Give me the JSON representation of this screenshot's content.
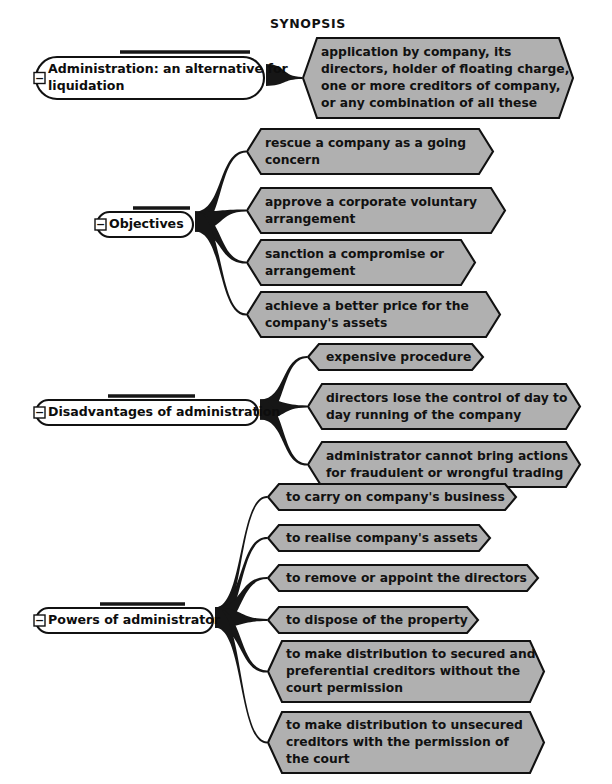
{
  "document": {
    "title": "SYNOPSIS",
    "title_x": 270,
    "title_y": 16
  },
  "style": {
    "page_background": "#ffffff",
    "leaf_fill": "#b0b0b0",
    "leaf_stroke": "#111111",
    "parent_fill": "#ffffff",
    "parent_stroke": "#111111",
    "connector_color": "#161616",
    "text_color": "#111111"
  },
  "mindmap": {
    "collapse_glyph": "−",
    "branches": [
      {
        "id": "administration",
        "parent": {
          "label": "Administration: an alternative for liquidation",
          "lines": [
            "Administration: an alternative for",
            "liquidation"
          ],
          "x": 36,
          "y": 57,
          "width": 228,
          "height": 42,
          "collapsed": false,
          "underline_x1": 120,
          "underline_x2": 250,
          "underline_y": 52
        },
        "children": [
          {
            "label": "application by company, its directors, holder of floating charge, one or more creditors of company, or any combination of all these",
            "lines": [
              "application by company, its",
              "directors, holder of floating charge,",
              "one or more creditors of company,",
              "or any combination of all these"
            ],
            "x": 303,
            "y": 38,
            "width": 270,
            "height": 80
          }
        ]
      },
      {
        "id": "objectives",
        "parent": {
          "label": "Objectives",
          "lines": [
            "Objectives"
          ],
          "x": 97,
          "y": 212,
          "width": 96,
          "height": 25,
          "collapsed": false,
          "underline_x1": 133,
          "underline_x2": 190,
          "underline_y": 208
        },
        "children": [
          {
            "label": "rescue a company as a going concern",
            "lines": [
              "rescue a company as a going",
              "concern"
            ],
            "x": 247,
            "y": 129,
            "width": 246,
            "height": 45
          },
          {
            "label": "approve a corporate voluntary arrangement",
            "lines": [
              "approve a corporate voluntary",
              "arrangement"
            ],
            "x": 247,
            "y": 188,
            "width": 258,
            "height": 45
          },
          {
            "label": "sanction a compromise or arrangement",
            "lines": [
              "sanction a compromise or",
              "arrangement"
            ],
            "x": 247,
            "y": 240,
            "width": 228,
            "height": 45
          },
          {
            "label": "achieve a better price for the company's assets",
            "lines": [
              "achieve a better price for the",
              "company's assets"
            ],
            "x": 247,
            "y": 292,
            "width": 253,
            "height": 45
          }
        ]
      },
      {
        "id": "disadvantages",
        "parent": {
          "label": "Disadvantages of administration",
          "lines": [
            "Disadvantages of administration"
          ],
          "x": 36,
          "y": 400,
          "width": 222,
          "height": 25,
          "collapsed": false,
          "underline_x1": 108,
          "underline_x2": 195,
          "underline_y": 396
        },
        "children": [
          {
            "label": "expensive procedure",
            "lines": [
              "expensive procedure"
            ],
            "x": 308,
            "y": 344,
            "width": 175,
            "height": 26
          },
          {
            "label": "directors lose the control of day to day running of the company",
            "lines": [
              "directors lose the control of day to",
              "day running of the company"
            ],
            "x": 308,
            "y": 384,
            "width": 272,
            "height": 45
          },
          {
            "label": "administrator cannot bring actions for fraudulent or wrongful trading",
            "lines": [
              "administrator cannot bring actions",
              "for fraudulent or wrongful trading"
            ],
            "x": 308,
            "y": 442,
            "width": 272,
            "height": 45
          }
        ]
      },
      {
        "id": "powers",
        "parent": {
          "label": "Powers of administrator",
          "lines": [
            "Powers of administrator"
          ],
          "x": 36,
          "y": 608,
          "width": 177,
          "height": 25,
          "collapsed": false,
          "underline_x1": 100,
          "underline_x2": 185,
          "underline_y": 604
        },
        "children": [
          {
            "label": "to carry on company's business",
            "lines": [
              "to carry on company's business"
            ],
            "x": 268,
            "y": 484,
            "width": 248,
            "height": 26
          },
          {
            "label": "to realise company's assets",
            "lines": [
              "to realise company's assets"
            ],
            "x": 268,
            "y": 525,
            "width": 222,
            "height": 26
          },
          {
            "label": "to remove or appoint the directors",
            "lines": [
              "to remove or appoint the directors"
            ],
            "x": 268,
            "y": 565,
            "width": 270,
            "height": 26
          },
          {
            "label": "to dispose of the property",
            "lines": [
              "to dispose of the property"
            ],
            "x": 268,
            "y": 607,
            "width": 210,
            "height": 26
          },
          {
            "label": "to make distribution to secured and preferential creditors without the court permission",
            "lines": [
              "to make distribution to secured and",
              "preferential creditors without the",
              "court permission"
            ],
            "x": 268,
            "y": 641,
            "width": 276,
            "height": 61
          },
          {
            "label": "to make distribution to unsecured creditors with the permission of the court",
            "lines": [
              "to make distribution to unsecured",
              "creditors with the permission of",
              "the court"
            ],
            "x": 268,
            "y": 712,
            "width": 276,
            "height": 61
          }
        ]
      }
    ]
  }
}
